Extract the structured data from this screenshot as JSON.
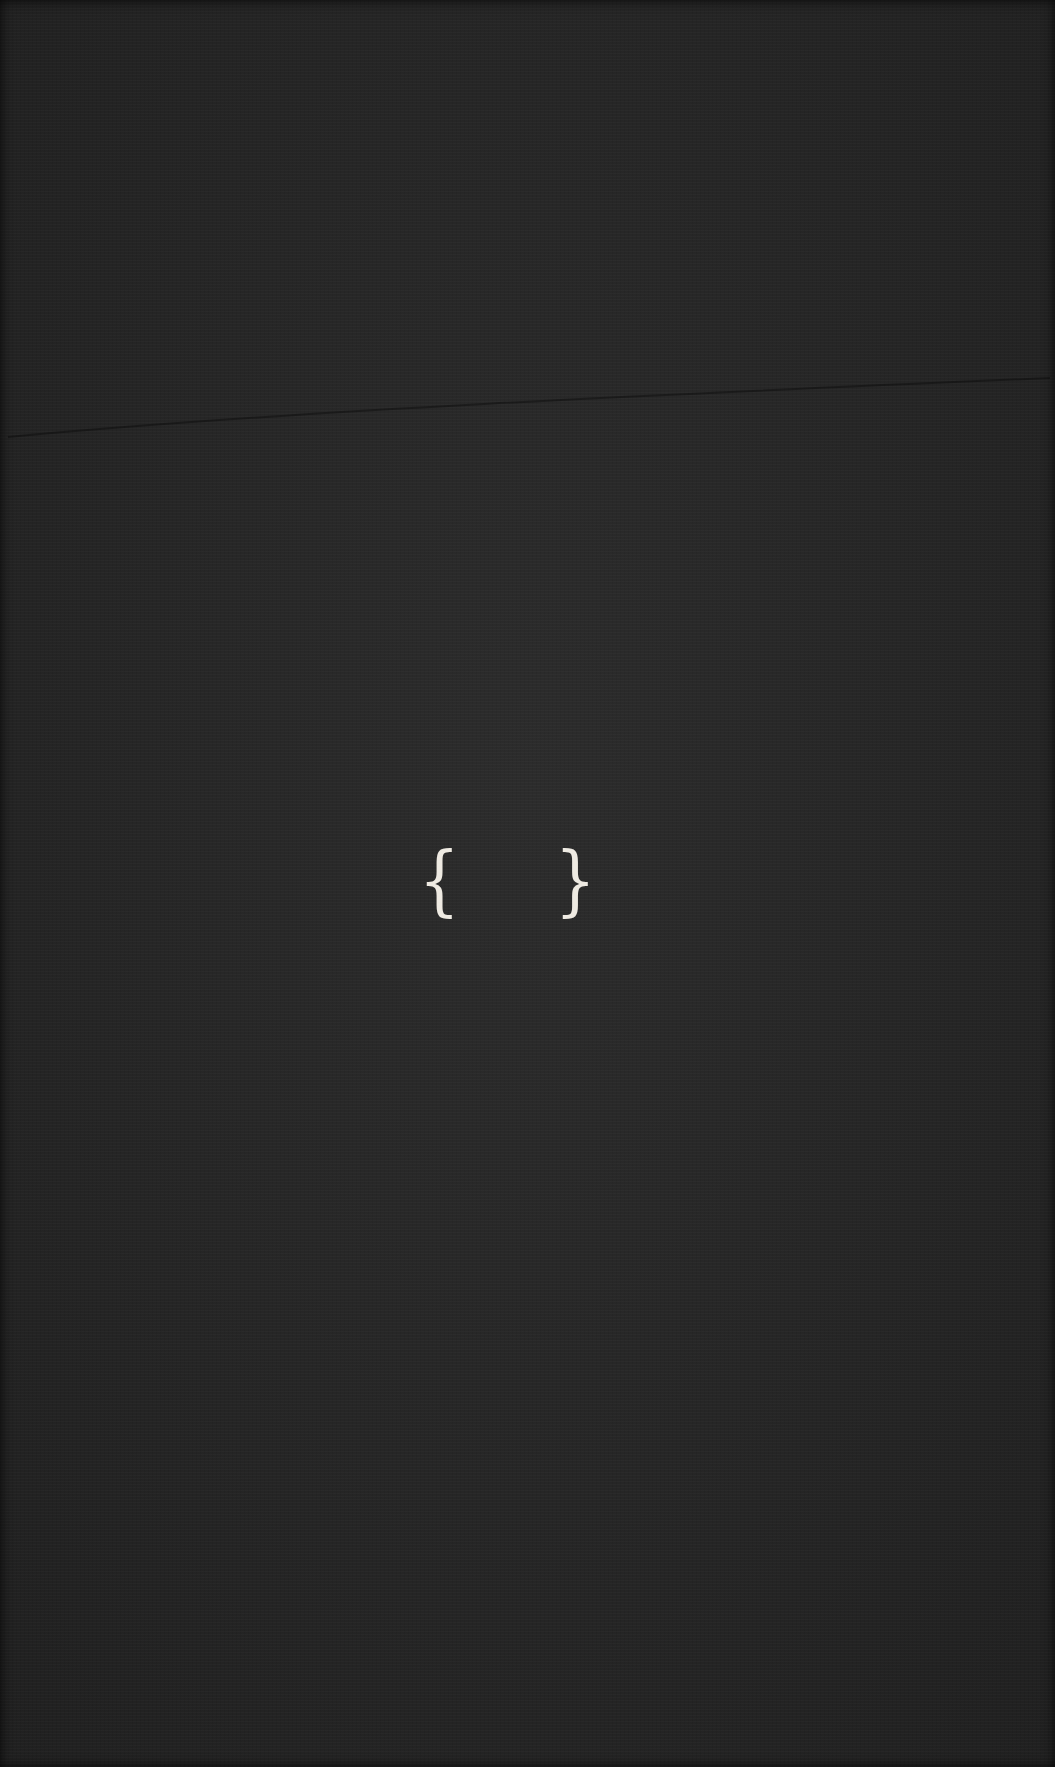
{
  "page": {
    "background_color": "#272727",
    "foreground_color": "#eeeae2"
  },
  "content": {
    "left_brace": "{",
    "right_brace": "}"
  }
}
